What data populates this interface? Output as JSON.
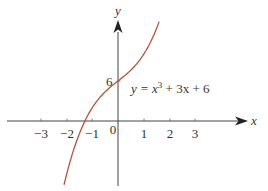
{
  "chart_data": {
    "type": "line",
    "title": "",
    "function": "y = x^3 + 3x + 6",
    "annotation": {
      "equation_parts": [
        "y = x",
        "3",
        " + 3x + 6"
      ],
      "y_intercept_label": "6"
    },
    "xlabel": "x",
    "ylabel": "y",
    "x_ticks": [
      -3,
      -2,
      -1,
      0,
      1,
      2,
      3
    ],
    "x_tick_labels": [
      "−3",
      "−2",
      "−1",
      "0",
      "1",
      "2",
      "3"
    ],
    "y_ticks": [
      6
    ],
    "y_tick_labels": [
      "6"
    ],
    "xlim": [
      -4.3,
      5.4
    ],
    "ylim": [
      -10,
      16
    ],
    "x_domain_plotted": [
      -2.1,
      1.6
    ],
    "grid": false,
    "legend": null,
    "series": [
      {
        "name": "y = x^3 + 3x + 6",
        "color": "#b5533a",
        "x": [
          -2.1,
          -2.0,
          -1.75,
          -1.5,
          -1.25,
          -1.0,
          -0.75,
          -0.5,
          -0.25,
          0,
          0.25,
          0.5,
          0.75,
          1.0,
          1.25,
          1.5,
          1.6
        ],
        "y": [
          -9.56,
          -8.0,
          -4.61,
          -2.88,
          -1.7,
          2.0,
          3.33,
          4.38,
          5.23,
          6.0,
          6.77,
          7.63,
          8.67,
          10.0,
          11.7,
          13.88,
          14.9
        ]
      }
    ]
  },
  "style": {
    "axis_color": "#333333",
    "curve_color": "#b5533a"
  }
}
